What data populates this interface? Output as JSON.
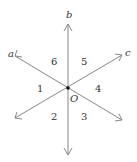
{
  "diagram": {
    "origin_label": "O",
    "lines": [
      {
        "name": "a",
        "label": "a"
      },
      {
        "name": "b",
        "label": "b"
      },
      {
        "name": "c",
        "label": "c"
      }
    ],
    "regions": [
      "1",
      "2",
      "3",
      "4",
      "5",
      "6"
    ],
    "colors": {
      "line": "#888888",
      "text": "#333333",
      "point": "#111111"
    }
  }
}
